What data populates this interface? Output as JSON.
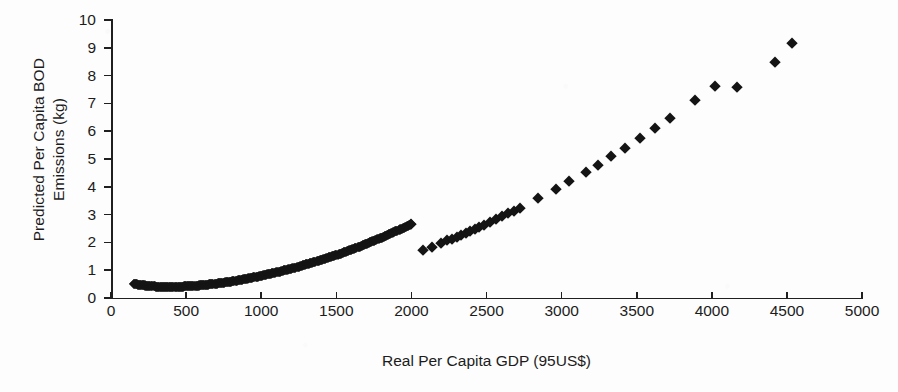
{
  "chart_data": {
    "type": "scatter",
    "title": "",
    "xlabel": "Real Per Capita GDP (95US$)",
    "ylabel_line_1": "Predicted Per Capita BOD",
    "ylabel_line_2": "Emissions (kg)",
    "xlim": [
      0,
      5000
    ],
    "ylim": [
      0,
      10
    ],
    "grid": false,
    "legend": "none",
    "marker": "filled-diamond",
    "marker_color": "#141414",
    "xticks": [
      0,
      500,
      1000,
      1500,
      2000,
      2500,
      3000,
      3500,
      4000,
      4500,
      5000
    ],
    "xtick_labels": [
      "0",
      "500",
      "1000",
      "1500",
      "2000",
      "2500",
      "3000",
      "3500",
      "4000",
      "4500",
      "5000"
    ],
    "yticks": [
      0,
      1,
      2,
      3,
      4,
      5,
      6,
      7,
      8,
      9,
      10
    ],
    "ytick_labels": [
      "0",
      "1",
      "2",
      "3",
      "4",
      "5",
      "6",
      "7",
      "8",
      "9",
      "10"
    ],
    "relationship": "monotonically increasing convex (quadratic-like) curve",
    "series": [
      {
        "name": "Predicted per capita BOD emissions",
        "x": [
          150,
          165,
          180,
          195,
          210,
          225,
          240,
          255,
          270,
          285,
          300,
          315,
          330,
          345,
          360,
          375,
          390,
          405,
          420,
          435,
          450,
          465,
          480,
          495,
          510,
          525,
          540,
          555,
          570,
          585,
          600,
          615,
          630,
          645,
          660,
          675,
          690,
          705,
          720,
          735,
          750,
          770,
          790,
          810,
          830,
          850,
          870,
          890,
          910,
          930,
          950,
          975,
          1000,
          1025,
          1050,
          1075,
          1100,
          1125,
          1150,
          1175,
          1200,
          1225,
          1250,
          1275,
          1300,
          1325,
          1350,
          1375,
          1400,
          1425,
          1450,
          1475,
          1500,
          1525,
          1550,
          1575,
          1600,
          1625,
          1650,
          1675,
          1700,
          1725,
          1750,
          1775,
          1800,
          1825,
          1850,
          1875,
          1900,
          1925,
          1950,
          1975,
          2000,
          2080,
          2140,
          2200,
          2240,
          2270,
          2300,
          2330,
          2360,
          2390,
          2420,
          2450,
          2480,
          2520,
          2560,
          2600,
          2640,
          2680,
          2720,
          2840,
          2960,
          3050,
          3160,
          3240,
          3330,
          3420,
          3520,
          3620,
          3720,
          3890,
          4020,
          4170,
          4420,
          4533
        ],
        "y": [
          0.52,
          0.5,
          0.48,
          0.47,
          0.46,
          0.45,
          0.44,
          0.43,
          0.42,
          0.42,
          0.41,
          0.41,
          0.4,
          0.4,
          0.4,
          0.4,
          0.4,
          0.4,
          0.4,
          0.4,
          0.41,
          0.41,
          0.41,
          0.42,
          0.42,
          0.43,
          0.43,
          0.44,
          0.44,
          0.45,
          0.46,
          0.46,
          0.47,
          0.48,
          0.49,
          0.5,
          0.51,
          0.52,
          0.53,
          0.54,
          0.55,
          0.57,
          0.58,
          0.6,
          0.62,
          0.64,
          0.66,
          0.68,
          0.7,
          0.72,
          0.74,
          0.77,
          0.8,
          0.83,
          0.86,
          0.89,
          0.92,
          0.95,
          0.99,
          1.02,
          1.06,
          1.09,
          1.13,
          1.17,
          1.21,
          1.25,
          1.29,
          1.33,
          1.37,
          1.41,
          1.46,
          1.5,
          1.55,
          1.59,
          1.64,
          1.69,
          1.74,
          1.79,
          1.84,
          1.89,
          1.95,
          2.0,
          2.06,
          2.11,
          2.17,
          2.23,
          2.29,
          2.35,
          2.41,
          2.47,
          2.53,
          2.6,
          2.66,
          1.72,
          1.85,
          1.98,
          2.07,
          2.14,
          2.21,
          2.28,
          2.35,
          2.42,
          2.5,
          2.57,
          2.64,
          2.74,
          2.84,
          2.94,
          3.04,
          3.14,
          3.25,
          3.58,
          3.93,
          4.2,
          4.55,
          4.8,
          5.1,
          5.41,
          5.76,
          6.11,
          6.48,
          7.13,
          7.64,
          7.6,
          8.5,
          9.17
        ]
      }
    ]
  },
  "axis_render": {
    "x_pixel_origin": 111,
    "x_pixel_per_unit": 0.15022,
    "y_pixel_baseline": 298,
    "y_pixel_per_unit": 27.8
  }
}
